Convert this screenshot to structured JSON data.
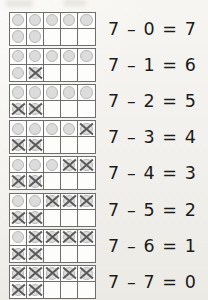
{
  "worksheet": {
    "fact_family": 7,
    "frame": {
      "columns": 5,
      "rows": 2,
      "capacity": 10
    },
    "cross_out_order": [
      "b2",
      "b1",
      "t5",
      "t4",
      "t3",
      "t2",
      "t1"
    ],
    "rows": [
      {
        "equation": "7 – 0 = 7",
        "minuend": 7,
        "subtrahend": 0,
        "difference": 7,
        "counters": 7,
        "crossed": 0,
        "top": [
          "dot",
          "dot",
          "dot",
          "dot",
          "dot"
        ],
        "bottom": [
          "dot",
          "dot",
          "empty",
          "empty",
          "empty"
        ]
      },
      {
        "equation": "7 – 1 = 6",
        "minuend": 7,
        "subtrahend": 1,
        "difference": 6,
        "counters": 7,
        "crossed": 1,
        "top": [
          "dot",
          "dot",
          "dot",
          "dot",
          "dot"
        ],
        "bottom": [
          "dot",
          "crossed",
          "empty",
          "empty",
          "empty"
        ]
      },
      {
        "equation": "7 – 2 = 5",
        "minuend": 7,
        "subtrahend": 2,
        "difference": 5,
        "counters": 7,
        "crossed": 2,
        "top": [
          "dot",
          "dot",
          "dot",
          "dot",
          "dot"
        ],
        "bottom": [
          "crossed",
          "crossed",
          "empty",
          "empty",
          "empty"
        ]
      },
      {
        "equation": "7 – 3 = 4",
        "minuend": 7,
        "subtrahend": 3,
        "difference": 4,
        "counters": 7,
        "crossed": 3,
        "top": [
          "dot",
          "dot",
          "dot",
          "dot",
          "crossed"
        ],
        "bottom": [
          "crossed",
          "crossed",
          "empty",
          "empty",
          "empty"
        ]
      },
      {
        "equation": "7 – 4 = 3",
        "minuend": 7,
        "subtrahend": 4,
        "difference": 3,
        "counters": 7,
        "crossed": 4,
        "top": [
          "dot",
          "dot",
          "dot",
          "crossed",
          "crossed"
        ],
        "bottom": [
          "crossed",
          "crossed",
          "empty",
          "empty",
          "empty"
        ]
      },
      {
        "equation": "7 – 5 = 2",
        "minuend": 7,
        "subtrahend": 5,
        "difference": 2,
        "counters": 7,
        "crossed": 5,
        "top": [
          "dot",
          "dot",
          "crossed",
          "crossed",
          "crossed"
        ],
        "bottom": [
          "crossed",
          "crossed",
          "empty",
          "empty",
          "empty"
        ]
      },
      {
        "equation": "7 – 6 = 1",
        "minuend": 7,
        "subtrahend": 6,
        "difference": 1,
        "counters": 7,
        "crossed": 6,
        "top": [
          "dot",
          "crossed",
          "crossed",
          "crossed",
          "crossed"
        ],
        "bottom": [
          "crossed",
          "crossed",
          "empty",
          "empty",
          "empty"
        ]
      },
      {
        "equation": "7 – 7 = 0",
        "minuend": 7,
        "subtrahend": 7,
        "difference": 0,
        "counters": 7,
        "crossed": 7,
        "top": [
          "crossed",
          "crossed",
          "crossed",
          "crossed",
          "crossed"
        ],
        "bottom": [
          "crossed",
          "crossed",
          "empty",
          "empty",
          "empty"
        ]
      }
    ]
  },
  "colors": {
    "paper": "#f2f1ed",
    "counter_fill": "#dcdcdc",
    "counter_stroke": "#b9b9b9",
    "grid_line": "#6e6e6e",
    "x_stroke": "#5a5a5a",
    "equation_text": "#1b1b1b"
  }
}
